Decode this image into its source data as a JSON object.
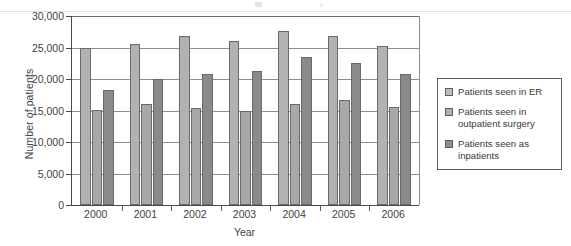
{
  "chart_data": {
    "type": "bar",
    "title": "",
    "xlabel": "Year",
    "ylabel": "Number of patients",
    "categories": [
      "2000",
      "2001",
      "2002",
      "2003",
      "2004",
      "2005",
      "2006"
    ],
    "series": [
      {
        "name": "Patients seen in ER",
        "color": "#b2b2b2",
        "values": [
          25000,
          25500,
          26800,
          26000,
          27700,
          26800,
          25200
        ]
      },
      {
        "name": "Patients seen in outpatient surgery",
        "color": "#a8a8a8",
        "values": [
          15100,
          16000,
          15400,
          15000,
          16100,
          16600,
          15500
        ]
      },
      {
        "name": "Patients seen as inpatients",
        "color": "#8a8a8a",
        "values": [
          18300,
          20000,
          20800,
          21200,
          23500,
          22500,
          20800
        ]
      }
    ],
    "ylim": [
      0,
      30000
    ],
    "ytick_values": [
      0,
      5000,
      10000,
      15000,
      20000,
      25000,
      30000
    ],
    "ytick_labels": [
      "0",
      "5,000",
      "10,000",
      "15,000",
      "20,000",
      "25,000",
      "30,000"
    ],
    "grid": true,
    "legend_position": "right"
  },
  "legend": {
    "items": [
      {
        "label": "Patients seen in ER"
      },
      {
        "label": "Patients seen in outpatient surgery"
      },
      {
        "label": "Patients seen as inpatients"
      }
    ]
  }
}
